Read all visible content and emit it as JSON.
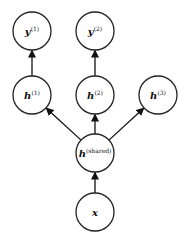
{
  "diagram": {
    "type": "multi-task neural network graph",
    "nodes": [
      {
        "id": "y1",
        "base": "y",
        "sup": "(1)",
        "cx": 32,
        "cy": 31
      },
      {
        "id": "y2",
        "base": "y",
        "sup": "(2)",
        "cx": 95,
        "cy": 31
      },
      {
        "id": "h1",
        "base": "h",
        "sup": "(1)",
        "cx": 32,
        "cy": 95
      },
      {
        "id": "h2",
        "base": "h",
        "sup": "(2)",
        "cx": 95,
        "cy": 95
      },
      {
        "id": "h3",
        "base": "h",
        "sup": "(3)",
        "cx": 158,
        "cy": 95
      },
      {
        "id": "hshared",
        "base": "h",
        "sup": "(shared)",
        "cx": 95,
        "cy": 153
      },
      {
        "id": "x",
        "base": "x",
        "sup": "",
        "cx": 95,
        "cy": 212
      }
    ],
    "edges": [
      {
        "from": "x",
        "to": "hshared"
      },
      {
        "from": "hshared",
        "to": "h1"
      },
      {
        "from": "hshared",
        "to": "h2"
      },
      {
        "from": "hshared",
        "to": "h3"
      },
      {
        "from": "h1",
        "to": "y1"
      },
      {
        "from": "h2",
        "to": "y2"
      }
    ],
    "node_radius": 19,
    "colors": {
      "stroke": "#222222",
      "fill": "#ffffff",
      "arrow": "#111111"
    }
  }
}
